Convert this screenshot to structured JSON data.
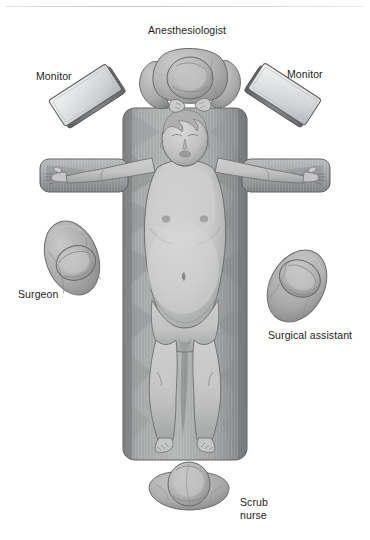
{
  "figure": {
    "style": "grayscale medical illustration, patient supine on operating table, viewed from above"
  },
  "labels": {
    "anesthesiologist": "Anesthesiologist",
    "monitor_left": "Monitor",
    "monitor_right": "Monitor",
    "surgeon": "Surgeon",
    "surgical_assistant": "Surgical assistant",
    "scrub_nurse": "Scrub\nnurse"
  },
  "caption": {
    "text": ""
  },
  "colors": {
    "background": "#ffffff",
    "text": "#1c1c1c",
    "rule": "#d2d2d2",
    "table_dark": "#7d7f80",
    "table_mid": "#9a9c9d",
    "table_light": "#b9bbbc",
    "skin_light": "#cfd0cf",
    "skin_mid": "#b3b4b3",
    "skin_shadow": "#909192",
    "cap_light": "#c6c7c6",
    "cap_mid": "#a9aaa9",
    "cap_dark": "#878988",
    "monitor_light": "#e9eaea",
    "monitor_mid": "#c6c8c9",
    "monitor_edge": "#6f7173",
    "outline": "#5f6162"
  },
  "scene": {
    "operating_table": {
      "name": "operating-table",
      "x": 123,
      "y": 108,
      "width": 124,
      "height": 352
    },
    "arm_boards": {
      "left": {
        "x": 40,
        "y": 160,
        "width": 86,
        "height": 32
      },
      "right": {
        "x": 244,
        "y": 160,
        "width": 86,
        "height": 32
      }
    },
    "patient": {
      "name": "patient-supine",
      "position": "supine",
      "head_cx": 186,
      "head_cy": 138
    },
    "personnel": [
      {
        "name": "anesthesiologist",
        "cx": 190,
        "cy": 78
      },
      {
        "name": "surgeon",
        "cx": 72,
        "cy": 258
      },
      {
        "name": "surgical-assistant",
        "cx": 297,
        "cy": 286
      },
      {
        "name": "scrub-nurse",
        "cx": 190,
        "cy": 494
      }
    ],
    "monitors": [
      {
        "name": "monitor-left",
        "cx": 89,
        "cy": 97,
        "rotation": -35
      },
      {
        "name": "monitor-right",
        "cx": 280,
        "cy": 95,
        "rotation": 35
      }
    ]
  }
}
